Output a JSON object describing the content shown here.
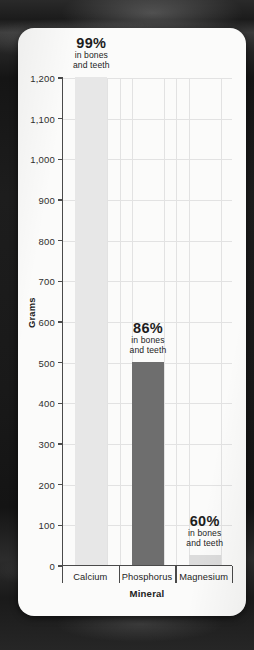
{
  "chart_data": {
    "type": "bar",
    "title": "",
    "xlabel": "Mineral",
    "ylabel": "Grams",
    "categories": [
      "Calcium",
      "Phosphorus",
      "Magnesium"
    ],
    "values": [
      1200,
      500,
      25
    ],
    "ylim": [
      0,
      1200
    ],
    "yticks": [
      0,
      100,
      200,
      300,
      400,
      500,
      600,
      700,
      800,
      900,
      1000,
      1100,
      1200
    ],
    "ytick_labels": [
      "0",
      "100",
      "200",
      "300",
      "400",
      "500",
      "600",
      "700",
      "800",
      "900",
      "1,000",
      "1,100",
      "1,200"
    ],
    "grid": true,
    "legend": "none",
    "bar_colors": [
      "#e7e7e7",
      "#6e6e6e",
      "#dcdcdc"
    ],
    "annotations": [
      {
        "percent": "99%",
        "line1": "in bones",
        "line2": "and teeth"
      },
      {
        "percent": "86%",
        "line1": "in bones",
        "line2": "and teeth"
      },
      {
        "percent": "60%",
        "line1": "in bones",
        "line2": "and teeth"
      }
    ]
  },
  "colors": {
    "card_background": "#fbfbfa",
    "page_background": "#1a1a1a",
    "axis": "#4a4a4a",
    "gridline": "#e2e2e2",
    "text": "#1d1d1d"
  }
}
